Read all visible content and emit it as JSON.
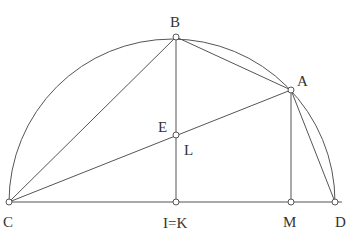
{
  "diagram": {
    "type": "geometry-construction",
    "colors": {
      "stroke": "#555555",
      "point_fill": "#ffffff",
      "label": "#333333",
      "background": "#ffffff"
    },
    "points": {
      "C": {
        "label": "C",
        "x": 9,
        "y": 202
      },
      "D": {
        "label": "D",
        "x": 335,
        "y": 202
      },
      "B": {
        "label": "B",
        "x": 176,
        "y": 37
      },
      "A": {
        "label": "A",
        "x": 291,
        "y": 90
      },
      "EL": {
        "label_E": "E",
        "label_L": "L",
        "x": 176,
        "y": 135
      },
      "IK": {
        "label": "I=K",
        "x": 176,
        "y": 202
      },
      "M": {
        "label": "M",
        "x": 291,
        "y": 202
      }
    },
    "segments": [
      {
        "from": "C",
        "to": "D",
        "name": "diameter"
      },
      {
        "from": "C",
        "to": "B"
      },
      {
        "from": "B",
        "to": "A"
      },
      {
        "from": "A",
        "to": "D"
      },
      {
        "from": "C",
        "to": "A"
      },
      {
        "from": "B",
        "to": "I=K"
      },
      {
        "from": "A",
        "to": "M"
      }
    ],
    "arc": {
      "from": "C",
      "to": "D",
      "through": [
        "B",
        "A"
      ],
      "kind": "semicircle"
    }
  }
}
